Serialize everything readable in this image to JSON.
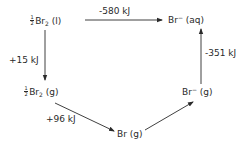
{
  "diagram": {
    "type": "thermochemical cycle",
    "nodes": {
      "br2_liquid": {
        "coef_num": "1",
        "coef_den": "2",
        "formula": "Br",
        "subscript": "2",
        "state": "(l)"
      },
      "br_minus_aq": {
        "formula": "Br",
        "superscript": "−",
        "state": "(aq)"
      },
      "br2_gas": {
        "coef_num": "1",
        "coef_den": "2",
        "formula": "Br",
        "subscript": "2",
        "state": "(g)"
      },
      "br_gas": {
        "formula": "Br",
        "state": "(g)"
      },
      "br_minus_gas": {
        "formula": "Br",
        "superscript": "−",
        "state": "(g)"
      }
    },
    "edges": [
      {
        "from": "br2_liquid",
        "to": "br_minus_aq",
        "label": "-580 kJ"
      },
      {
        "from": "br2_liquid",
        "to": "br2_gas",
        "label": "+15 kJ"
      },
      {
        "from": "br2_gas",
        "to": "br_gas",
        "label": "+96 kJ"
      },
      {
        "from": "br_gas",
        "to": "br_minus_gas",
        "label": ""
      },
      {
        "from": "br_minus_gas",
        "to": "br_minus_aq",
        "label": "-351 kJ"
      }
    ],
    "line_color": "#2a2a2a",
    "background": "#ffffff"
  }
}
